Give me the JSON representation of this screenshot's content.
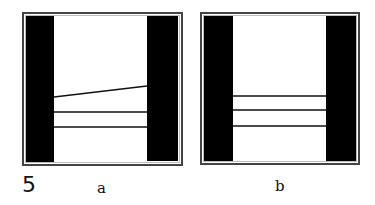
{
  "figure": {
    "number": "5",
    "panels": [
      {
        "id": "a",
        "label": "a",
        "lines": [
          {
            "kind": "sloped",
            "y_left": 97,
            "y_right": 86
          },
          {
            "kind": "horizontal",
            "y_left": 112,
            "y_right": 112
          },
          {
            "kind": "horizontal",
            "y_left": 127,
            "y_right": 127
          }
        ]
      },
      {
        "id": "b",
        "label": "b",
        "lines": [
          {
            "kind": "horizontal",
            "y_left": 96,
            "y_right": 96
          },
          {
            "kind": "horizontal",
            "y_left": 110,
            "y_right": 110
          },
          {
            "kind": "horizontal",
            "y_left": 126,
            "y_right": 126
          }
        ]
      }
    ]
  },
  "colors": {
    "bar": "#000000",
    "frame": "#444444",
    "line": "#111111",
    "background": "#ffffff"
  }
}
